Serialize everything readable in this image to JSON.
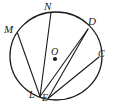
{
  "figure": {
    "type": "circle-geometry-diagram",
    "width": 113,
    "height": 111,
    "background_color": "#ffffff",
    "stroke_color": "#1a1a1a",
    "circle": {
      "center_label": "O",
      "center_x": 56,
      "center_y": 56,
      "radius_x": 46,
      "radius_y": 44
    },
    "center_dot": {
      "x": 55,
      "y": 59,
      "radius": 2.1
    },
    "points": [
      {
        "id": "M",
        "label": "M",
        "x": 17.5,
        "y": 33.0,
        "label_x": 4,
        "label_y": 24
      },
      {
        "id": "N",
        "label": "N",
        "x": 51.0,
        "y": 12.5,
        "label_x": 44,
        "label_y": 1
      },
      {
        "id": "D",
        "label": "D",
        "x": 88.0,
        "y": 29.0,
        "label_x": 88,
        "label_y": 16
      },
      {
        "id": "C",
        "label": "C",
        "x": 99.0,
        "y": 57.0,
        "label_x": 98,
        "label_y": 49
      },
      {
        "id": "L",
        "label": "L",
        "x": 40.0,
        "y": 96.5,
        "label_x": 29,
        "label_y": 90
      },
      {
        "id": "E",
        "label": "E",
        "x": 48.0,
        "y": 98.5,
        "label_x": 42,
        "label_y": 93
      }
    ],
    "chords": [
      {
        "id": "ML",
        "from": "M",
        "to": "L"
      },
      {
        "id": "NL",
        "from": "N",
        "to": "L"
      },
      {
        "id": "DE",
        "from": "D",
        "to": "E"
      },
      {
        "id": "CE",
        "from": "C",
        "to": "E"
      },
      {
        "id": "DL",
        "from": "D",
        "to": "L"
      }
    ]
  }
}
